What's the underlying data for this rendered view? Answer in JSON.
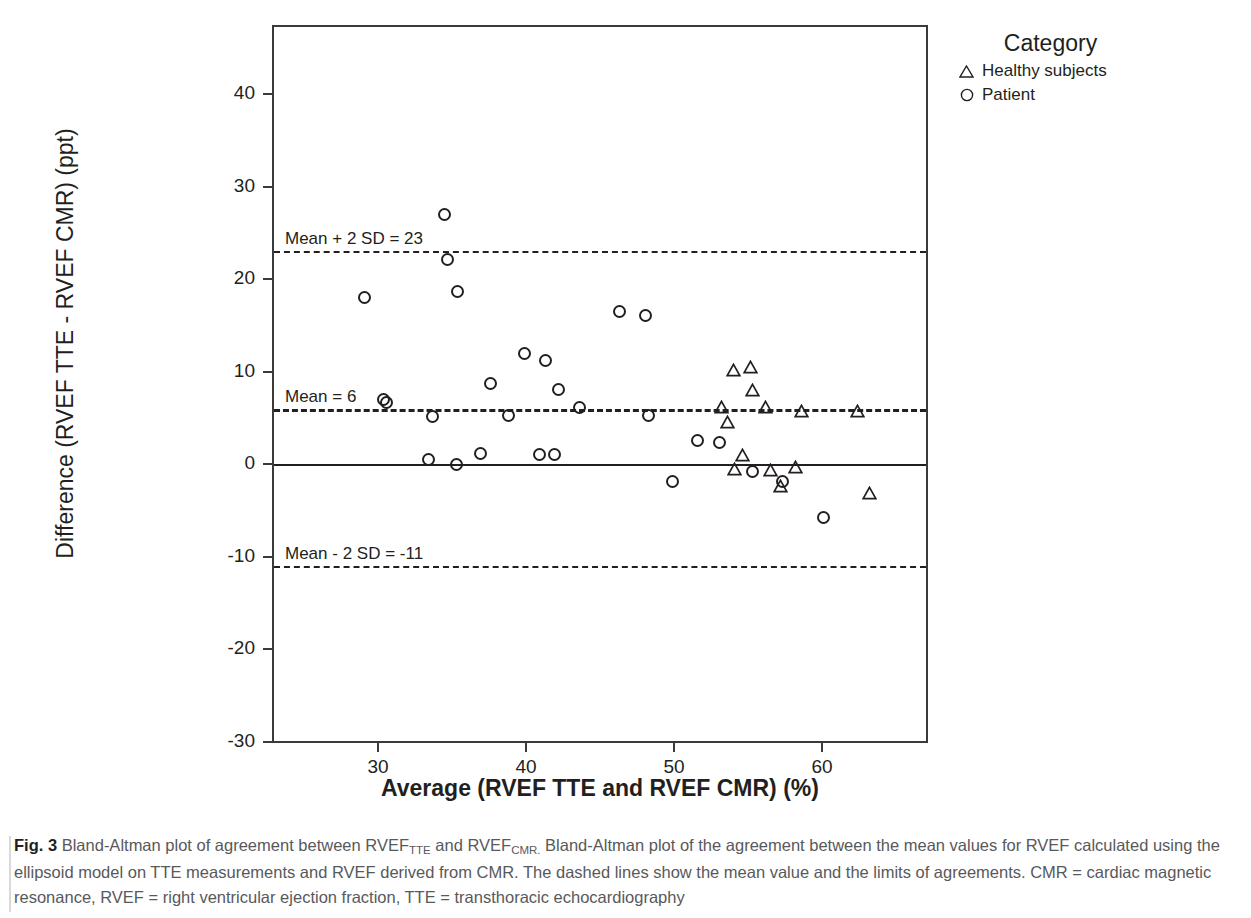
{
  "figure": {
    "label": "Fig. 3",
    "caption_part1": "Bland-Altman plot of agreement between RVEF",
    "caption_sub1": "TTE",
    "caption_part2": " and RVEF",
    "caption_sub2": "CMR.",
    "caption_part3": " Bland-Altman plot of the agreement between the mean values for RVEF calculated using the ellipsoid model on TTE measurements and RVEF derived from CMR. The dashed lines show the mean value and the limits of agreements. CMR = cardiac magnetic resonance, RVEF = right ventricular ejection fraction, TTE = transthoracic echocardiography"
  },
  "legend": {
    "title": "Category",
    "items": [
      {
        "label": "Healthy subjects",
        "marker": "triangle-marker"
      },
      {
        "label": "Patient",
        "marker": "circle-marker"
      }
    ]
  },
  "chart_data": {
    "type": "scatter",
    "title": "",
    "xlabel": "Average (RVEF TTE and RVEF CMR) (%)",
    "ylabel": "Difference (RVEF TTE - RVEF CMR) (ppt)",
    "xlim": [
      23.5,
      67.8
    ],
    "ylim": [
      -30,
      47.6
    ],
    "xticks": [
      30,
      40,
      50,
      60
    ],
    "yticks": [
      -30,
      -20,
      -10,
      0,
      10,
      20,
      30,
      40
    ],
    "grid": false,
    "legend_position": "top-right-outside",
    "reference_lines": [
      {
        "name": "upper-limit-of-agreement",
        "label": "Mean + 2 SD = 23",
        "value": 23,
        "style": "dashed"
      },
      {
        "name": "mean-difference",
        "label": "Mean = 6",
        "value": 6,
        "style": "dashed-long"
      },
      {
        "name": "zero-line",
        "label": "",
        "value": 0,
        "style": "solid"
      },
      {
        "name": "lower-limit-of-agreement",
        "label": "Mean - 2 SD = -11",
        "value": -11,
        "style": "dashed"
      }
    ],
    "series": [
      {
        "name": "Patient",
        "marker": "circle",
        "points": [
          [
            29.1,
            18.0
          ],
          [
            30.4,
            7.0
          ],
          [
            30.6,
            6.6
          ],
          [
            33.4,
            0.5
          ],
          [
            33.7,
            5.1
          ],
          [
            34.5,
            27.0
          ],
          [
            34.7,
            22.1
          ],
          [
            35.3,
            0.0
          ],
          [
            35.4,
            18.6
          ],
          [
            36.9,
            1.1
          ],
          [
            37.6,
            8.7
          ],
          [
            38.8,
            5.2
          ],
          [
            39.9,
            12.0
          ],
          [
            40.9,
            1.0
          ],
          [
            41.3,
            11.2
          ],
          [
            41.9,
            1.0
          ],
          [
            42.2,
            8.1
          ],
          [
            43.6,
            6.1
          ],
          [
            46.3,
            16.5
          ],
          [
            48.1,
            16.1
          ],
          [
            48.3,
            5.2
          ],
          [
            49.9,
            -1.9
          ],
          [
            51.6,
            2.5
          ],
          [
            53.1,
            2.3
          ],
          [
            55.3,
            -0.8
          ],
          [
            57.3,
            -1.9
          ],
          [
            60.1,
            -5.8
          ]
        ]
      },
      {
        "name": "Healthy subjects",
        "marker": "triangle",
        "points": [
          [
            53.2,
            6.0
          ],
          [
            53.6,
            4.3
          ],
          [
            54.0,
            9.9
          ],
          [
            54.6,
            0.8
          ],
          [
            54.1,
            -0.8
          ],
          [
            55.2,
            10.3
          ],
          [
            55.3,
            7.8
          ],
          [
            56.2,
            6.0
          ],
          [
            56.5,
            -0.9
          ],
          [
            57.2,
            -2.6
          ],
          [
            58.2,
            -0.5
          ],
          [
            58.6,
            5.5
          ],
          [
            62.4,
            5.5
          ],
          [
            63.2,
            -3.3
          ]
        ]
      }
    ]
  }
}
